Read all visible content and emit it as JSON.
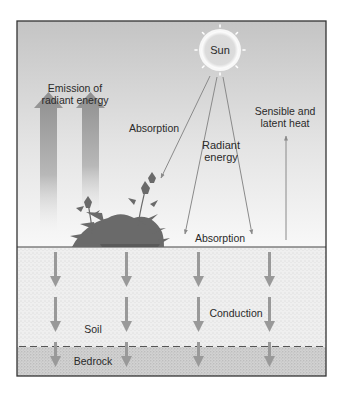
{
  "diagram": {
    "sun_label": "Sun",
    "labels": {
      "emission_line1": "Emission of",
      "emission_line2": "radiant energy",
      "absorption_plants": "Absorption",
      "radiant_line1": "Radiant",
      "radiant_line2": "energy",
      "sensible_line1": "Sensible and",
      "sensible_line2": "latent heat",
      "absorption_ground": "Absorption",
      "conduction": "Conduction",
      "soil": "Soil",
      "bedrock": "Bedrock"
    },
    "layers": [
      "Atmosphere",
      "Soil",
      "Bedrock"
    ],
    "colors": {
      "frame": "#333333",
      "sky_top": "#c4c4c4",
      "sky_bottom": "#f8f8f8",
      "soil": "#eeeeee",
      "bedrock": "#cfcfcf",
      "arrow": "#999999",
      "thin_arrow": "#8a8a8a",
      "plant": "#6a6a6a"
    }
  }
}
